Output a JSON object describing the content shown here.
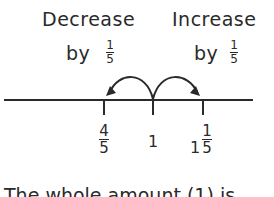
{
  "labels": {
    "decrease": "Decrease",
    "decrease_by": "by",
    "increase": "Increase",
    "increase_by": "by",
    "step_num": "1",
    "step_den": "5"
  },
  "ticks": [
    {
      "whole": "",
      "num": "4",
      "den": "5"
    },
    {
      "whole": "1",
      "num": "",
      "den": ""
    },
    {
      "whole": "1",
      "num": "1",
      "den": "5"
    }
  ],
  "bottom_text": "The whole amount (1) is",
  "colors": {
    "ink": "#2a2a2a",
    "background": "#ffffff"
  }
}
